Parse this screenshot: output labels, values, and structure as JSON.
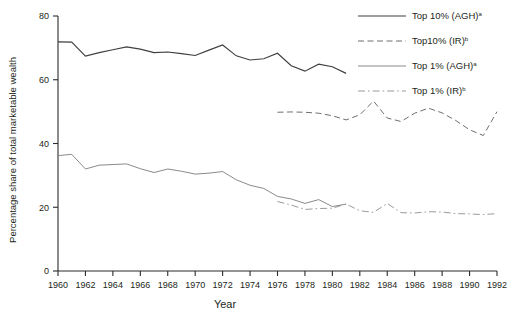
{
  "chart_data": {
    "type": "line",
    "title": "",
    "xlabel": "Year",
    "ylabel": "Percentage share of total marketable wealth",
    "xlim": [
      1960,
      1992
    ],
    "ylim": [
      0,
      80
    ],
    "yticks": [
      0,
      20,
      40,
      60,
      80
    ],
    "xticks": [
      1960,
      1962,
      1964,
      1966,
      1968,
      1970,
      1972,
      1974,
      1976,
      1978,
      1980,
      1982,
      1984,
      1986,
      1988,
      1990,
      1992
    ],
    "grid": false,
    "legend_position": "top-right",
    "series": [
      {
        "name": "Top 10% (AGH)",
        "superscript": "a",
        "style": "solid",
        "color": "#3f3f3f",
        "x": [
          1960,
          1961,
          1962,
          1963,
          1964,
          1965,
          1966,
          1967,
          1968,
          1969,
          1970,
          1971,
          1972,
          1973,
          1974,
          1975,
          1976,
          1977,
          1978,
          1979,
          1980,
          1981
        ],
        "values": [
          71.9,
          71.8,
          67.4,
          68.5,
          69.4,
          70.3,
          69.6,
          68.5,
          68.7,
          68.2,
          67.6,
          69.3,
          70.9,
          67.5,
          66.2,
          66.6,
          68.3,
          64.4,
          62.7,
          64.9,
          64.1,
          62.0
        ]
      },
      {
        "name": "Top10% (IR)",
        "superscript": "b",
        "style": "dashed",
        "color": "#6f6f6f",
        "x": [
          1976,
          1977,
          1978,
          1979,
          1980,
          1981,
          1982,
          1983,
          1984,
          1985,
          1986,
          1987,
          1988,
          1989,
          1990,
          1991,
          1992
        ],
        "values": [
          49.8,
          49.9,
          49.8,
          49.5,
          48.7,
          47.4,
          49.0,
          53.3,
          48.0,
          46.9,
          49.5,
          51.1,
          49.6,
          47.2,
          44.3,
          42.5,
          50.0
        ]
      },
      {
        "name": "Top 1% (AGH)",
        "superscript": "a",
        "style": "solid",
        "color": "#8a8a8a",
        "x": [
          1960,
          1961,
          1962,
          1963,
          1964,
          1965,
          1966,
          1967,
          1968,
          1969,
          1970,
          1971,
          1972,
          1973,
          1974,
          1975,
          1976,
          1977,
          1978,
          1979,
          1980,
          1981
        ],
        "values": [
          36.2,
          36.6,
          32.0,
          33.2,
          33.4,
          33.6,
          32.1,
          30.9,
          32.0,
          31.3,
          30.4,
          30.7,
          31.2,
          28.6,
          26.9,
          25.9,
          23.4,
          22.6,
          21.2,
          22.4,
          20.2,
          21.0
        ]
      },
      {
        "name": "Top 1% (IR)",
        "superscript": "b",
        "style": "dashdot",
        "color": "#9a9a9a",
        "x": [
          1976,
          1977,
          1978,
          1979,
          1980,
          1981,
          1982,
          1983,
          1984,
          1985,
          1986,
          1987,
          1988,
          1989,
          1990,
          1991,
          1992
        ],
        "values": [
          21.8,
          20.7,
          19.3,
          19.6,
          19.7,
          21.0,
          18.9,
          18.4,
          21.2,
          18.3,
          18.2,
          18.6,
          18.5,
          18.0,
          17.9,
          17.7,
          18.0
        ]
      }
    ]
  },
  "axes": {
    "y_title": "Percentage share of total marketable wealth",
    "x_title": "Year",
    "ytick_labels": [
      "0",
      "20",
      "40",
      "60",
      "80"
    ],
    "xtick_labels": [
      "1960",
      "1962",
      "1964",
      "1966",
      "1968",
      "1970",
      "1972",
      "1974",
      "1976",
      "1978",
      "1980",
      "1982",
      "1984",
      "1986",
      "1988",
      "1990",
      "1992"
    ]
  },
  "legend": {
    "items": [
      {
        "label": "Top 10% (AGH)",
        "sup": "a"
      },
      {
        "label": "Top10% (IR)",
        "sup": "b"
      },
      {
        "label": "Top 1% (AGH)",
        "sup": "a"
      },
      {
        "label": "Top 1% (IR)",
        "sup": "b"
      }
    ]
  }
}
